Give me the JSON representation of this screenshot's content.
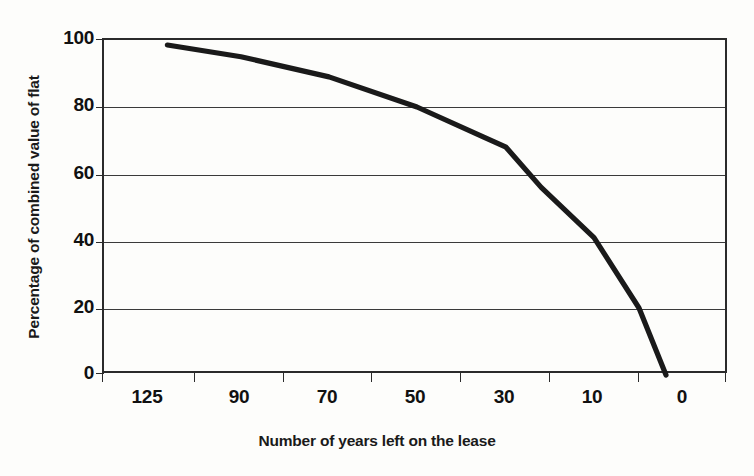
{
  "chart_data": {
    "type": "line",
    "title": "",
    "xlabel": "Number of years left on the lease",
    "ylabel": "Percentage of combined value of flat",
    "ylim": [
      0,
      100
    ],
    "yticks": [
      0,
      20,
      40,
      60,
      80,
      100
    ],
    "ytick_labels": [
      "0",
      "20",
      "40",
      "60",
      "80",
      "100"
    ],
    "xtick_labels": [
      "125",
      "90",
      "70",
      "50",
      "30",
      "10",
      "0"
    ],
    "xtick_values": [
      125,
      90,
      70,
      50,
      30,
      10,
      0
    ],
    "grid": "horizontal",
    "legend": "none",
    "series": [
      {
        "name": "Percentage of combined value of flat",
        "color": "#1a1a1a",
        "x": [
          118,
          90,
          70,
          50,
          35,
          30,
          22,
          10,
          5,
          2
        ],
        "values": [
          98.5,
          95.0,
          89.0,
          80.0,
          71.0,
          68.0,
          56.0,
          41.0,
          20.0,
          0.0
        ]
      }
    ]
  },
  "axis": {
    "y_title": "Percentage of combined value of flat",
    "x_title": "Number of years left on the lease",
    "y_ticks": [
      "100",
      "80",
      "60",
      "40",
      "20",
      "0"
    ],
    "x_ticks": [
      "125",
      "90",
      "70",
      "50",
      "30",
      "10",
      "0"
    ]
  },
  "colors": {
    "line": "#1a1a1a",
    "frame": "#2b2b2b",
    "grid": "#3a3a3a",
    "background": "#fdfdfb",
    "text": "#111111"
  }
}
